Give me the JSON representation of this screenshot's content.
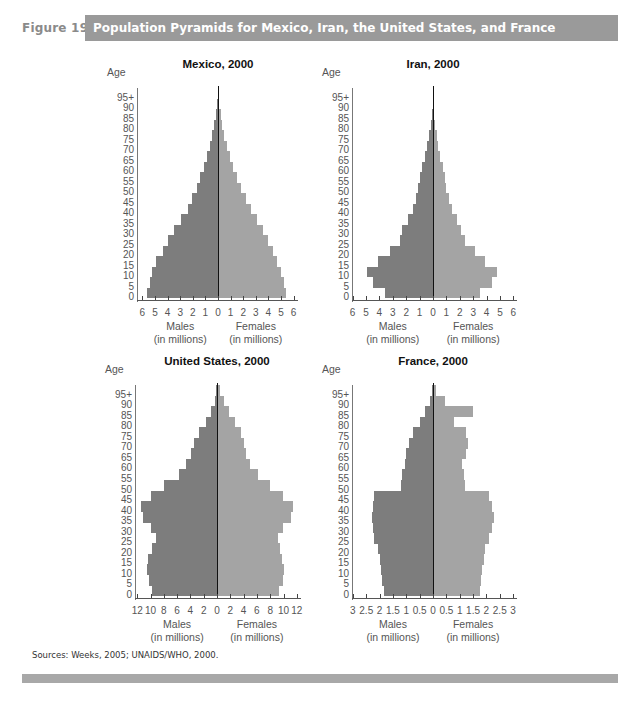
{
  "figure": {
    "label": "Figure 19.2",
    "title": "Population Pyramids for Mexico, Iran, the United States, and France",
    "sources": "Sources: Weeks, 2005; UNAIDS/WHO, 2000.",
    "colors": {
      "title_bar": "#9a9a9a",
      "males": "#7d7d7d",
      "females": "#a4a4a4",
      "center_line": "#111111",
      "bottom_rule": "#a8a8a8"
    }
  },
  "axis_common": {
    "age_label": "Age",
    "age_ticks": [
      "0",
      "5",
      "10",
      "15",
      "20",
      "25",
      "30",
      "35",
      "40",
      "45",
      "50",
      "55",
      "60",
      "65",
      "70",
      "75",
      "80",
      "85",
      "90",
      "95+"
    ],
    "males_label": "Males",
    "females_label": "Females",
    "units_label": "(in millions)"
  },
  "chart_data": [
    {
      "type": "bar",
      "subtype": "population-pyramid",
      "title": "Mexico, 2000",
      "categories": [
        "0-4",
        "5-9",
        "10-14",
        "15-19",
        "20-24",
        "25-29",
        "30-34",
        "35-39",
        "40-44",
        "45-49",
        "50-54",
        "55-59",
        "60-64",
        "65-69",
        "70-74",
        "75-79",
        "80-84",
        "85-89",
        "90-94",
        "95+"
      ],
      "series": [
        {
          "name": "Males",
          "values": [
            5.6,
            5.4,
            5.2,
            4.9,
            4.4,
            4.0,
            3.5,
            2.9,
            2.4,
            2.1,
            1.7,
            1.4,
            1.1,
            0.85,
            0.6,
            0.45,
            0.3,
            0.15,
            0.07,
            0.03
          ]
        },
        {
          "name": "Females",
          "values": [
            5.4,
            5.2,
            5.0,
            4.7,
            4.4,
            4.0,
            3.6,
            3.1,
            2.6,
            2.2,
            1.8,
            1.5,
            1.2,
            0.95,
            0.7,
            0.5,
            0.35,
            0.2,
            0.09,
            0.04
          ]
        }
      ],
      "xlabel_left": "Males (in millions)",
      "xlabel_right": "Females (in millions)",
      "ylabel": "Age",
      "xlim": [
        -6,
        6
      ],
      "x_tick_labels": [
        "6",
        "5",
        "4",
        "3",
        "2",
        "1",
        "0",
        "1",
        "2",
        "3",
        "4",
        "5",
        "6"
      ]
    },
    {
      "type": "bar",
      "subtype": "population-pyramid",
      "title": "Iran, 2000",
      "categories": [
        "0-4",
        "5-9",
        "10-14",
        "15-19",
        "20-24",
        "25-29",
        "30-34",
        "35-39",
        "40-44",
        "45-49",
        "50-54",
        "55-59",
        "60-64",
        "65-69",
        "70-74",
        "75-79",
        "80-84",
        "85-89",
        "90-94",
        "95+"
      ],
      "series": [
        {
          "name": "Males",
          "values": [
            3.6,
            4.5,
            4.9,
            4.1,
            3.2,
            2.5,
            2.3,
            1.9,
            1.5,
            1.3,
            1.1,
            0.95,
            0.8,
            0.6,
            0.45,
            0.3,
            0.18,
            0.08,
            0.03,
            0.01
          ]
        },
        {
          "name": "Females",
          "values": [
            3.5,
            4.4,
            4.8,
            3.9,
            3.1,
            2.4,
            2.1,
            1.8,
            1.4,
            1.2,
            1.0,
            0.9,
            0.75,
            0.55,
            0.4,
            0.28,
            0.16,
            0.07,
            0.03,
            0.01
          ]
        }
      ],
      "xlabel_left": "Males (in millions)",
      "xlabel_right": "Females (in millions)",
      "ylabel": "Age",
      "xlim": [
        -6,
        6
      ],
      "x_tick_labels": [
        "6",
        "5",
        "4",
        "3",
        "2",
        "1",
        "0",
        "1",
        "2",
        "3",
        "4",
        "5",
        "6"
      ]
    },
    {
      "type": "bar",
      "subtype": "population-pyramid",
      "title": "United States, 2000",
      "categories": [
        "0-4",
        "5-9",
        "10-14",
        "15-19",
        "20-24",
        "25-29",
        "30-34",
        "35-39",
        "40-44",
        "45-49",
        "50-54",
        "55-59",
        "60-64",
        "65-69",
        "70-74",
        "75-79",
        "80-84",
        "85-89",
        "90-94",
        "95+"
      ],
      "series": [
        {
          "name": "Males",
          "values": [
            9.8,
            10.3,
            10.5,
            10.4,
            9.7,
            9.2,
            9.9,
            11.2,
            11.5,
            9.9,
            8.0,
            5.7,
            4.6,
            3.9,
            3.4,
            2.7,
            1.7,
            0.9,
            0.35,
            0.1
          ]
        },
        {
          "name": "Females",
          "values": [
            9.3,
            9.9,
            10.1,
            9.8,
            9.5,
            9.1,
            9.9,
            11.1,
            11.5,
            9.9,
            8.0,
            6.1,
            4.9,
            4.4,
            4.1,
            3.6,
            2.7,
            1.8,
            1.0,
            0.5
          ]
        }
      ],
      "xlabel_left": "Males (in millions)",
      "xlabel_right": "Females (in millions)",
      "ylabel": "Age",
      "xlim": [
        -12,
        12
      ],
      "x_tick_labels": [
        "12",
        "10",
        "8",
        "6",
        "4",
        "2",
        "0",
        "2",
        "4",
        "6",
        "8",
        "10",
        "12"
      ]
    },
    {
      "type": "bar",
      "subtype": "population-pyramid",
      "title": "France, 2000",
      "categories": [
        "0-4",
        "5-9",
        "10-14",
        "15-19",
        "20-24",
        "25-29",
        "30-34",
        "35-39",
        "40-44",
        "45-49",
        "50-54",
        "55-59",
        "60-64",
        "65-69",
        "70-74",
        "75-79",
        "80-84",
        "85-89",
        "90-94",
        "95+"
      ],
      "series": [
        {
          "name": "Males",
          "values": [
            1.85,
            1.9,
            1.95,
            2.0,
            2.05,
            2.2,
            2.25,
            2.3,
            2.25,
            2.2,
            1.2,
            1.15,
            1.05,
            1.0,
            0.9,
            0.75,
            0.5,
            0.3,
            0.1,
            0.03
          ]
        },
        {
          "name": "Females",
          "values": [
            1.75,
            1.8,
            1.85,
            1.9,
            1.95,
            2.1,
            2.2,
            2.3,
            2.2,
            2.1,
            1.2,
            1.15,
            1.1,
            1.25,
            1.3,
            1.25,
            0.8,
            1.5,
            0.45,
            0.1
          ]
        }
      ],
      "xlabel_left": "Males (in millions)",
      "xlabel_right": "Females (in millions)",
      "ylabel": "Age",
      "xlim": [
        -3,
        3
      ],
      "x_tick_labels": [
        "3",
        "2.5",
        "2",
        "1.5",
        "1",
        "0.5",
        "0",
        "0.5",
        "1",
        "1.5",
        "2",
        "2.5",
        "3"
      ]
    }
  ]
}
